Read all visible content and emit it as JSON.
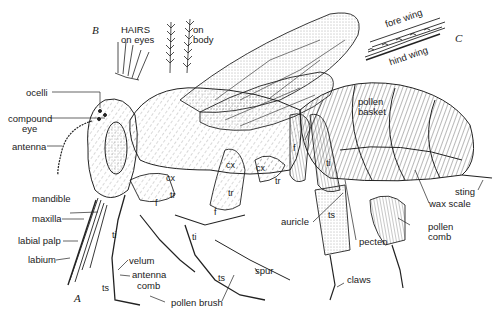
{
  "diagram": {
    "panels": {
      "A": "A",
      "B": "B",
      "C": "C"
    },
    "inset_B": {
      "title_line1": "HAIRS",
      "title_line2": "on eyes",
      "body_label_line1": "on",
      "body_label_line2": "body"
    },
    "inset_C": {
      "fore_wing": "fore wing",
      "hind_wing": "hind wing"
    },
    "labels": {
      "ocelli": "ocelli",
      "compound_eye_1": "compound",
      "compound_eye_2": "eye",
      "antenna": "antenna",
      "mandible": "mandible",
      "maxilla": "maxilla",
      "labial_palp": "labial  palp",
      "labium": "labium",
      "velum": "velum",
      "antenna_comb_1": "antenna",
      "antenna_comb_2": "comb",
      "pollen_brush": "pollen  brush",
      "spur": "spur",
      "claws": "claws",
      "auricle": "auricle",
      "pecten": "pecten",
      "pollen_comb_1": "pollen",
      "pollen_comb_2": "comb",
      "wax_scale": "wax  scale",
      "sting": "sting",
      "pollen_basket_1": "pollen",
      "pollen_basket_2": "basket"
    },
    "segment_labels": {
      "cx": "cx",
      "tr": "tr",
      "f": "f",
      "ti": "ti",
      "ts": "ts"
    }
  }
}
